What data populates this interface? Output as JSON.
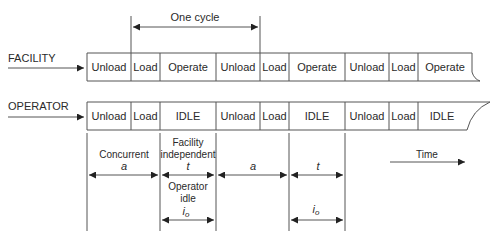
{
  "diagram": {
    "top_cycle": {
      "label": "One cycle"
    },
    "rows": [
      {
        "label": "FACILITY",
        "segments": [
          "Unload",
          "Load",
          "Operate",
          "Unload",
          "Load",
          "Operate",
          "Unload",
          "Load",
          "Operate"
        ]
      },
      {
        "label": "OPERATOR",
        "segments": [
          "Unload",
          "Load",
          "IDLE",
          "Unload",
          "Load",
          "IDLE",
          "Unload",
          "Load",
          "IDLE"
        ]
      }
    ],
    "dimensions": {
      "concurrent": {
        "label": "Concurrent",
        "symbol": "a"
      },
      "facility_independent": {
        "label_line1": "Facility",
        "label_line2": "independent",
        "symbol": "t"
      },
      "operator_idle": {
        "label_line1": "Operator",
        "label_line2": "idle",
        "symbol": "i",
        "subscript": "o"
      },
      "second_a": {
        "symbol": "a"
      },
      "second_t": {
        "symbol": "t"
      },
      "second_io": {
        "symbol": "i",
        "subscript": "o"
      }
    },
    "time_axis": {
      "label": "Time"
    },
    "colors": {
      "line": "#555555",
      "text": "#2a2a2a",
      "background": "#ffffff"
    }
  }
}
